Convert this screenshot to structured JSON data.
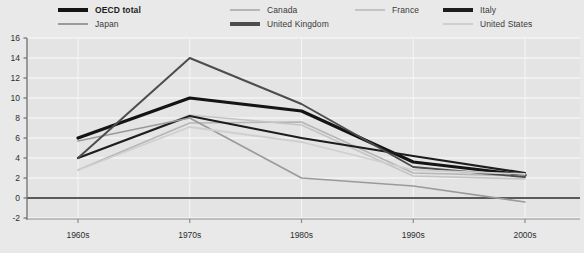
{
  "chart_data": {
    "type": "line",
    "title": "",
    "subtitle": "",
    "xlabel": "",
    "ylabel": "",
    "categories": [
      "1960s",
      "1970s",
      "1980s",
      "1990s",
      "2000s"
    ],
    "ylim": [
      -2,
      16
    ],
    "yticks": [
      -2,
      0,
      2,
      4,
      6,
      8,
      10,
      12,
      14,
      16
    ],
    "ytick_labels": [
      "-2",
      "0",
      "2",
      "4",
      "6",
      "8",
      "10",
      "12",
      "14",
      "16"
    ],
    "grid": "horizontal-and-vertical",
    "legend_position": "top",
    "zero_line": 0,
    "series": [
      {
        "name": "OECD total",
        "color": "#141414",
        "width": 3.2,
        "emphasis": "bold",
        "values": [
          6.0,
          10.0,
          8.7,
          3.6,
          2.3
        ]
      },
      {
        "name": "Canada",
        "color": "#b6b6b6",
        "width": 1.6,
        "emphasis": "normal",
        "values": [
          2.8,
          7.5,
          7.6,
          2.5,
          2.2
        ]
      },
      {
        "name": "France",
        "color": "#c4c4c4",
        "width": 1.6,
        "emphasis": "normal",
        "values": [
          4.0,
          8.3,
          7.3,
          2.2,
          1.9
        ]
      },
      {
        "name": "Italy",
        "color": "#1d1d1d",
        "width": 2.2,
        "emphasis": "normal",
        "values": [
          4.0,
          8.2,
          6.0,
          4.2,
          2.5
        ]
      },
      {
        "name": "Japan",
        "color": "#9a9a9a",
        "width": 1.6,
        "emphasis": "normal",
        "values": [
          5.7,
          8.0,
          2.0,
          1.2,
          -0.4
        ]
      },
      {
        "name": "United Kingdom",
        "color": "#4d4d4d",
        "width": 2.0,
        "emphasis": "normal",
        "values": [
          4.0,
          14.0,
          9.4,
          3.1,
          2.1
        ]
      },
      {
        "name": "United States",
        "color": "#cfcfcf",
        "width": 1.8,
        "emphasis": "normal",
        "values": [
          2.8,
          7.1,
          5.6,
          2.8,
          2.4
        ]
      }
    ]
  },
  "legend": {
    "items": [
      {
        "label": "OECD total",
        "color": "#141414",
        "weight": "bold",
        "thickness": "thick",
        "col": 0,
        "row": 0
      },
      {
        "label": "Canada",
        "color": "#b6b6b6",
        "weight": "normal",
        "thickness": "thin",
        "col": 1,
        "row": 0
      },
      {
        "label": "France",
        "color": "#c4c4c4",
        "weight": "normal",
        "thickness": "thin",
        "col": 2,
        "row": 0
      },
      {
        "label": "Italy",
        "color": "#1d1d1d",
        "weight": "normal",
        "thickness": "thick",
        "col": 3,
        "row": 0
      },
      {
        "label": "Japan",
        "color": "#9a9a9a",
        "weight": "normal",
        "thickness": "thin",
        "col": 0,
        "row": 1
      },
      {
        "label": "United Kingdom",
        "color": "#4d4d4d",
        "weight": "normal",
        "thickness": "thick",
        "col": 1,
        "row": 1
      },
      {
        "label": "United States",
        "color": "#cfcfcf",
        "weight": "normal",
        "thickness": "thin",
        "col": 3,
        "row": 1
      }
    ]
  },
  "colors": {
    "background": "#e9e9e9",
    "plot_background": "#e4e4e4",
    "grid": "#f4f4f4",
    "axis": "#6f6f6f",
    "zero_line": "#5a5a5a",
    "text": "#2e2e2e"
  }
}
